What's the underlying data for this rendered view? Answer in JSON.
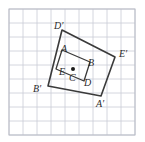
{
  "figure": {
    "background_color": "#ffffff",
    "grid": {
      "line_color": "#c9ccd6",
      "border_color": "#b9bcc6",
      "cell_size": 14,
      "cols": 9,
      "rows": 9,
      "origin_x": 9,
      "origin_y": 9,
      "visible": true
    },
    "shapes": {
      "inner_rectangle": {
        "name": "ABDE",
        "stroke_color": "#3a3a3a",
        "stroke_width": 1.3,
        "fill": "none",
        "points": "62,50 90,62 84,81 56,69"
      },
      "outer_rectangle": {
        "name": "A'B'D'E'",
        "stroke_color": "#3a3a3a",
        "stroke_width": 1.6,
        "fill": "none",
        "points": "62,30 115,57 101,96 48,86"
      },
      "center_point": {
        "name": "C",
        "color": "#1a1a1a",
        "radius": 2.0,
        "cx": 73,
        "cy": 69
      }
    },
    "labels": [
      {
        "id": "label-D-prime",
        "text": "D′",
        "x": 54,
        "y": 29,
        "anchor": "start"
      },
      {
        "id": "label-A",
        "text": "A",
        "x": 61,
        "y": 52,
        "anchor": "start"
      },
      {
        "id": "label-E-prime",
        "text": "E′",
        "x": 119,
        "y": 57,
        "anchor": "start"
      },
      {
        "id": "label-B",
        "text": "B",
        "x": 88,
        "y": 66,
        "anchor": "start"
      },
      {
        "id": "label-E",
        "text": "E",
        "x": 59,
        "y": 75,
        "anchor": "start"
      },
      {
        "id": "label-C",
        "text": "C",
        "x": 69,
        "y": 81,
        "anchor": "start"
      },
      {
        "id": "label-B-prime",
        "text": "B′",
        "x": 33,
        "y": 92,
        "anchor": "start"
      },
      {
        "id": "label-D",
        "text": "D",
        "x": 84,
        "y": 86,
        "anchor": "start"
      },
      {
        "id": "label-A-prime",
        "text": "A′",
        "x": 96,
        "y": 107,
        "anchor": "start"
      }
    ]
  }
}
